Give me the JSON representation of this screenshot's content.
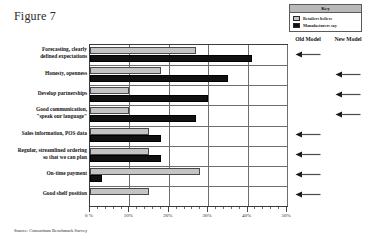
{
  "figure": {
    "title": "Figure 7",
    "source_note": "Source:  Consortium Benchmark Survey"
  },
  "key": {
    "title": "Key",
    "entries": [
      {
        "label": "Retailers believe",
        "color": "#c4c4c4",
        "swatch": "gray"
      },
      {
        "label": "Manufacturers say",
        "color": "#111111",
        "swatch": "black"
      }
    ]
  },
  "columns": {
    "old_model": "Old Model",
    "new_model": "New Model"
  },
  "chart_data": {
    "type": "bar",
    "orientation": "horizontal",
    "title": "Figure 7",
    "xlabel": "",
    "ylabel": "",
    "xlim": [
      0,
      50
    ],
    "xticks": [
      0,
      10,
      20,
      30,
      40,
      50
    ],
    "xtick_labels": [
      "0 %",
      "10%",
      "20%",
      "30%",
      "40%",
      "50%"
    ],
    "grid": true,
    "legend_position": "top-right",
    "categories": [
      "Forecasting, clearly defined expectations",
      "Honesty, openness",
      "Develop partnerships",
      "Good communication, \"speak our language\"",
      "Sales information, POS data",
      "Regular, streamlined ordering so that we can plan",
      "On-time payment",
      "Good shelf position"
    ],
    "category_lines": [
      [
        "Forecasting, clearly",
        "defined expectations"
      ],
      [
        "Honesty, openness"
      ],
      [
        "Develop partnerships"
      ],
      [
        "Good communication,",
        "\"speak our language\""
      ],
      [
        "Sales information, POS data"
      ],
      [
        "Regular, streamlined ordering",
        "so that we can plan"
      ],
      [
        "On-time payment"
      ],
      [
        "Good shelf position"
      ]
    ],
    "series": [
      {
        "name": "Retailers believe",
        "color": "#c4c4c4",
        "values": [
          27,
          18,
          10,
          10,
          15,
          15,
          28,
          15
        ]
      },
      {
        "name": "Manufacturers say",
        "color": "#111111",
        "values": [
          41,
          35,
          30,
          27,
          18,
          18,
          3,
          0
        ]
      }
    ],
    "model_markers": [
      "old",
      "new",
      "new",
      "new",
      "old",
      "old",
      "old",
      "old"
    ]
  }
}
